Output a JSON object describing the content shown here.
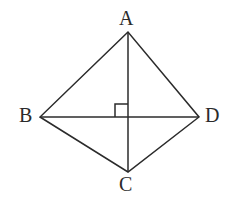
{
  "figure": {
    "kind": "geometry-diagram",
    "shape_name": "kite ABCD with perpendicular diagonals",
    "background_color": "#ffffff",
    "stroke_color": "#2b2b2b",
    "stroke_width": 1.5,
    "width": 243,
    "height": 204,
    "vertices": [
      {
        "id": "A",
        "label": "A",
        "x": 128,
        "y": 32,
        "label_x": 119,
        "label_y": 8,
        "position": "top"
      },
      {
        "id": "B",
        "label": "B",
        "x": 40,
        "y": 117,
        "label_x": 19,
        "label_y": 105,
        "position": "left"
      },
      {
        "id": "C",
        "label": "C",
        "x": 128,
        "y": 172,
        "label_x": 119,
        "label_y": 174,
        "position": "bottom"
      },
      {
        "id": "D",
        "label": "D",
        "x": 199,
        "y": 117,
        "label_x": 205,
        "label_y": 105,
        "position": "right"
      }
    ],
    "outline": {
      "name": "quadrilateral-ABCD",
      "points": "128,32 40,117 128,172 199,117",
      "closed": true
    },
    "diagonals": [
      {
        "id": "AC",
        "label": "A-C",
        "x1": 128,
        "y1": 32,
        "x2": 128,
        "y2": 172,
        "orientation": "vertical"
      },
      {
        "id": "BD",
        "label": "B-D",
        "x1": 40,
        "y1": 117,
        "x2": 199,
        "y2": 117,
        "orientation": "horizontal"
      }
    ],
    "intersection": {
      "id": "O",
      "x": 128,
      "y": 117
    },
    "right_angle_marker": {
      "name": "right-angle-square",
      "quadrant": "upper-left",
      "size": 13,
      "x": 115,
      "y": 104,
      "angle_degrees": 90,
      "points": "115,117 115,104 128,104"
    },
    "label_font_size": 20
  }
}
